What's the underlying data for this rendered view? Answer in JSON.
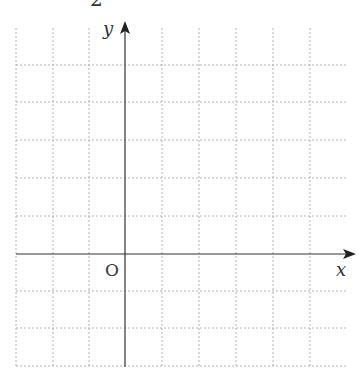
{
  "figure": {
    "number_label": "2",
    "axis_labels": {
      "x": "x",
      "y": "y",
      "origin": "O"
    },
    "grid": {
      "style": "dashed",
      "color": "#9a9a9a",
      "cell_px": 37,
      "columns_left_of_y_axis": 3,
      "columns_right_of_y_axis": 6,
      "rows_above_x_axis": 6,
      "rows_below_x_axis": 3
    },
    "axis_color": "#333333"
  }
}
